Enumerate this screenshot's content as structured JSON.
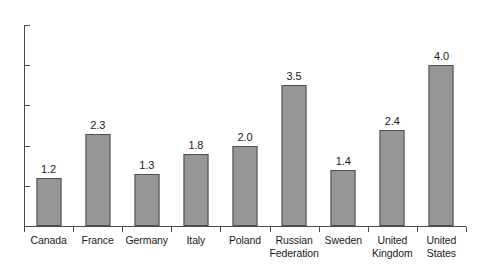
{
  "chart_data": {
    "type": "bar",
    "title": "",
    "subtitle": "",
    "xlabel": "",
    "ylabel": "",
    "ylim": [
      0,
      5
    ],
    "yticks": [
      "0",
      "1",
      "2",
      "3",
      "4",
      "5"
    ],
    "grid": false,
    "legend": false,
    "categories": [
      "Canada",
      "France",
      "Germany",
      "Italy",
      "Poland",
      "Russian Federation",
      "Sweden",
      "United Kingdom",
      "United States"
    ],
    "category_lines": [
      [
        "Canada"
      ],
      [
        "France"
      ],
      [
        "Germany"
      ],
      [
        "Italy"
      ],
      [
        "Poland"
      ],
      [
        "Russian",
        "Federation"
      ],
      [
        "Sweden"
      ],
      [
        "United",
        "Kingdom"
      ],
      [
        "United",
        "States"
      ]
    ],
    "values": [
      1.2,
      2.3,
      1.3,
      1.8,
      2.0,
      3.5,
      1.4,
      2.4,
      4.0
    ],
    "value_labels": [
      "1.2",
      "2.3",
      "1.3",
      "1.8",
      "2.0",
      "3.5",
      "1.4",
      "2.4",
      "4.0"
    ],
    "colors": {
      "bar_fill": "#969696",
      "bar_stroke": "#4f4f4f",
      "axis": "#4a4a4a",
      "text": "#1a1a1a",
      "background": "#ffffff"
    }
  }
}
